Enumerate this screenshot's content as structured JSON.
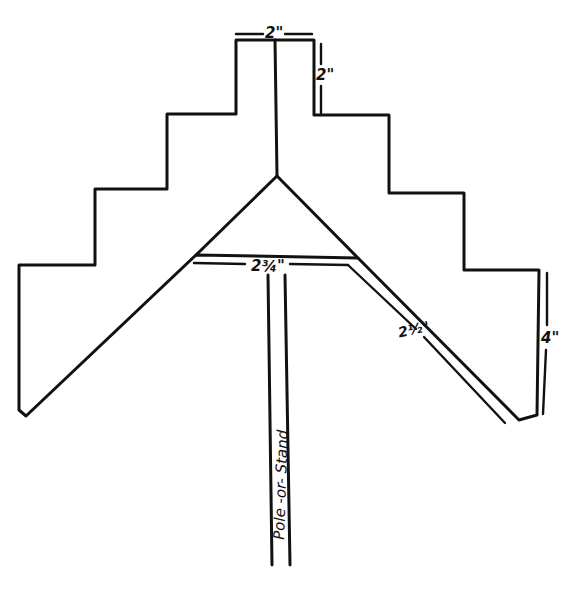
{
  "diagram": {
    "type": "hand-drawn pattern template",
    "colors": {
      "ink": "#111111",
      "paper": "#ffffff"
    },
    "labels": {
      "top_width": "2\"",
      "top_height": "2\"",
      "crossbar_width": "2¾\"",
      "arm_width": "2½\"",
      "side_height": "4\"",
      "pole": "Pole -or- Stand"
    }
  }
}
